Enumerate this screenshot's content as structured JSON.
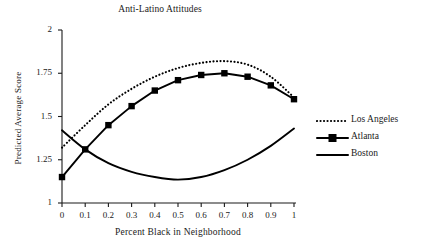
{
  "chart_data": {
    "type": "line",
    "title": "Anti-Latino Attitudes",
    "xlabel": "Percent Black in Neighborhood",
    "ylabel": "Predicted Average Score",
    "xlim": [
      0,
      1
    ],
    "ylim": [
      1,
      2
    ],
    "xticks": [
      "0",
      "0.1",
      "0.2",
      "0.3",
      "0.4",
      "0.5",
      "0.6",
      "0.7",
      "0.8",
      "0.9",
      "1"
    ],
    "yticks": [
      "1",
      "1.25",
      "1.5",
      "1.75",
      "2"
    ],
    "grid": false,
    "legend_position": "right",
    "x": [
      0,
      0.1,
      0.2,
      0.3,
      0.4,
      0.5,
      0.6,
      0.7,
      0.8,
      0.9,
      1
    ],
    "series": [
      {
        "name": "Los Angeles",
        "style": "dotted",
        "marker": "none",
        "color": "#000000",
        "values": [
          1.32,
          1.45,
          1.57,
          1.66,
          1.73,
          1.78,
          1.81,
          1.82,
          1.8,
          1.73,
          1.61
        ]
      },
      {
        "name": "Atlanta",
        "style": "solid",
        "marker": "square",
        "color": "#000000",
        "values": [
          1.15,
          1.31,
          1.45,
          1.56,
          1.65,
          1.71,
          1.74,
          1.75,
          1.73,
          1.68,
          1.6
        ]
      },
      {
        "name": "Boston",
        "style": "solid",
        "marker": "none",
        "color": "#000000",
        "values": [
          1.42,
          1.31,
          1.23,
          1.18,
          1.15,
          1.135,
          1.15,
          1.19,
          1.25,
          1.33,
          1.43
        ]
      }
    ]
  }
}
